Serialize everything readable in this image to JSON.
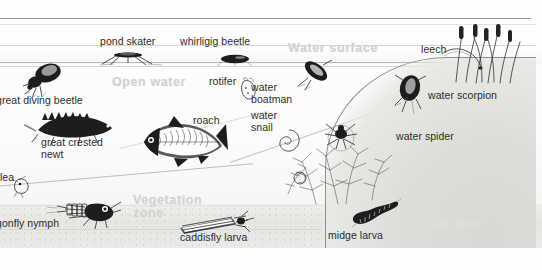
{
  "figure": {
    "kind": "labelled-diagram"
  },
  "zones": [
    {
      "id": "water-surface",
      "label": "Water surface",
      "color": "#d2d2d0"
    },
    {
      "id": "open-water",
      "label": "Open water",
      "color": "#d2d2d0"
    },
    {
      "id": "vegetation",
      "label": "Vegetation\nzone",
      "color": "#d2d2d0"
    },
    {
      "id": "bottom-mud",
      "label": "Bottom mud",
      "color": "#dcdcd8"
    }
  ],
  "organisms": [
    {
      "id": "pond-skater",
      "label": "pond skater"
    },
    {
      "id": "whirligig-beetle",
      "label": "whirligig beetle"
    },
    {
      "id": "leech",
      "label": "leech"
    },
    {
      "id": "great-diving-beetle",
      "label": "great diving beetle"
    },
    {
      "id": "rotifer",
      "label": "rotifer"
    },
    {
      "id": "water-boatman",
      "label": "water\nboatman"
    },
    {
      "id": "water-scorpion",
      "label": "water scorpion"
    },
    {
      "id": "great-crested-newt",
      "label": "great crested\nnewt"
    },
    {
      "id": "roach",
      "label": "roach"
    },
    {
      "id": "water-snail",
      "label": "water\nsnail"
    },
    {
      "id": "water-spider",
      "label": "water spider"
    },
    {
      "id": "water-flea",
      "label": "flea"
    },
    {
      "id": "dragonfly-nymph",
      "label": "gonfly nymph"
    },
    {
      "id": "caddisfly-larva",
      "label": "caddisfly larva"
    },
    {
      "id": "midge-larva",
      "label": "midge larva"
    }
  ],
  "palette": {
    "ink": "#1d1d1d",
    "label_text": "#2c2c2c",
    "zone_watermark": "#d2d2d0",
    "water": "#fbfbfb",
    "mud": "#e6e6e3",
    "frame": "#9a9a9a"
  }
}
